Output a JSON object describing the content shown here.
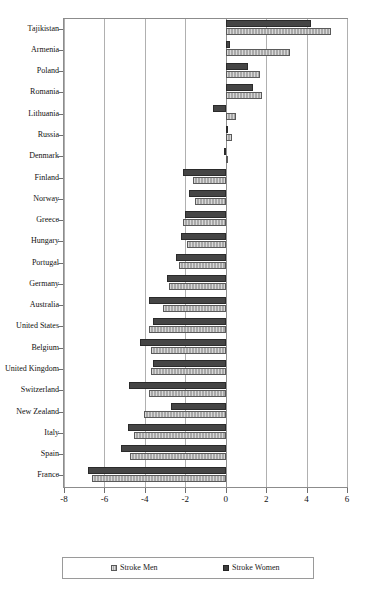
{
  "chart_data": {
    "type": "bar",
    "orientation": "horizontal",
    "title": "",
    "subtitle": "",
    "xlabel": "",
    "ylabel": "",
    "xlim": [
      -8,
      6
    ],
    "xticks": [
      -8,
      -6,
      -4,
      -2,
      0,
      2,
      4,
      6
    ],
    "xticklabels": [
      "-8",
      "-6",
      "-4",
      "-2",
      "0",
      "2",
      "4",
      "6"
    ],
    "grid": true,
    "grid_axis": "x",
    "legend_position": "bottom",
    "categories": [
      "Tajikistan",
      "Armenia",
      "Poland",
      "Romania",
      "Lithuania",
      "Russia",
      "Denmark",
      "Finland",
      "Norway",
      "Greece",
      "Hungary",
      "Portugal",
      "Germany",
      "Australia",
      "United States",
      "Belgium",
      "United Kingdom",
      "Switzerland",
      "New Zealand",
      "Italy",
      "Spain",
      "France"
    ],
    "series": [
      {
        "name": "Stroke Women",
        "color": "#454545",
        "values": [
          4.2,
          0.2,
          1.1,
          1.35,
          -0.65,
          0.0,
          -0.1,
          -2.1,
          -1.8,
          -2.0,
          -2.2,
          -2.45,
          -2.9,
          -3.8,
          -3.6,
          -4.25,
          -3.6,
          -4.8,
          -2.7,
          -4.85,
          -5.2,
          -6.8
        ]
      },
      {
        "name": "Stroke Men",
        "color": "#a8a8a8",
        "values": [
          5.2,
          3.2,
          1.7,
          1.8,
          0.5,
          0.3,
          0.0,
          -1.6,
          -1.5,
          -2.1,
          -1.9,
          -2.3,
          -2.8,
          -3.1,
          -3.8,
          -3.7,
          -3.7,
          -3.8,
          -4.05,
          -4.55,
          -4.75,
          -6.6
        ]
      }
    ],
    "legend": [
      {
        "label": "Stroke Men",
        "swatch": "men"
      },
      {
        "label": "Stroke Women",
        "swatch": "women"
      }
    ]
  }
}
